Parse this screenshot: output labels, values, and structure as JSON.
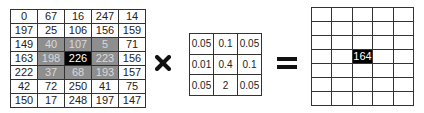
{
  "input_matrix": {
    "rows": [
      [
        "0",
        "67",
        "16",
        "247",
        "14"
      ],
      [
        "197",
        "25",
        "106",
        "156",
        "159"
      ],
      [
        "149",
        "40",
        "107",
        "5",
        "71"
      ],
      [
        "163",
        "198",
        "226",
        "223",
        "156"
      ],
      [
        "222",
        "37",
        "68",
        "193",
        "157"
      ],
      [
        "42",
        "72",
        "250",
        "41",
        "75"
      ],
      [
        "150",
        "17",
        "248",
        "197",
        "147"
      ]
    ],
    "highlight_region": {
      "row_start": 2,
      "row_end": 4,
      "col_start": 1,
      "col_end": 3
    },
    "center_cell": {
      "row": 3,
      "col": 2
    },
    "colors": {
      "shade": "#8e8e8e",
      "shade_text": "#d9d9d9",
      "center": "#000000",
      "center_text": "#ffffff"
    }
  },
  "operator_multiply": {
    "symbol": "×",
    "icon": "bold-x-icon"
  },
  "kernel": {
    "rows": [
      [
        "0.05",
        "0.1",
        "0.05"
      ],
      [
        "0.01",
        "0.4",
        "0.1"
      ],
      [
        "0.05",
        "2",
        "0.05"
      ]
    ]
  },
  "operator_equals": {
    "symbol": "=",
    "icon": "equals-icon"
  },
  "output_matrix": {
    "num_rows": 7,
    "num_cols": 5,
    "result_cell": {
      "row": 3,
      "col": 2,
      "value": "164"
    },
    "colors": {
      "result": "#000000",
      "result_text": "#ffffff"
    }
  }
}
